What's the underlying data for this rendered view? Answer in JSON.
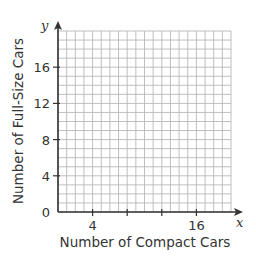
{
  "chart_data": {
    "type": "scatter",
    "title": "",
    "xlabel": "Number of Compact Cars",
    "ylabel": "Number of Full-Size Cars",
    "x_var": "x",
    "y_var": "y",
    "xlim": [
      0,
      20
    ],
    "ylim": [
      0,
      20
    ],
    "x_ticks": [
      4,
      8,
      12,
      16
    ],
    "x_tick_labels": [
      "4",
      "",
      "",
      "16"
    ],
    "y_ticks": [
      0,
      4,
      8,
      12,
      16
    ],
    "y_tick_labels": [
      "0",
      "4",
      "8",
      "12",
      "16"
    ],
    "grid": true,
    "grid_step": 1,
    "series": [],
    "colors": {
      "axis": "#333333",
      "grid": "#b8b8b8",
      "text": "#333333"
    }
  }
}
